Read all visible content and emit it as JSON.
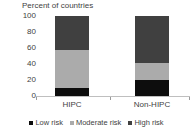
{
  "chart_data": {
    "type": "bar",
    "title": "Percent of countries",
    "subtitle": "",
    "xlabel": "",
    "ylabel": "Percent of countries",
    "stacked": true,
    "grid": false,
    "legend_position": "bottom",
    "ylim": [
      0,
      100
    ],
    "yticks": [
      0,
      20,
      40,
      60,
      80,
      100
    ],
    "ytick_labels": [
      "0",
      "20",
      "40",
      "60",
      "80",
      "100"
    ],
    "categories": [
      "HIPC",
      "Non-HIPC"
    ],
    "series": [
      {
        "name": "Low risk",
        "color": "#0d0d0d",
        "values": [
          10,
          20
        ]
      },
      {
        "name": "Moderate risk",
        "color": "#ababab",
        "values": [
          47,
          21
        ]
      },
      {
        "name": "High risk",
        "color": "#404040",
        "values": [
          43,
          59
        ]
      }
    ]
  },
  "axis": {
    "title": "Percent of countries",
    "ytick_labels": [
      "100",
      "80",
      "60",
      "40",
      "20",
      "0"
    ],
    "xtick_labels": [
      "HIPC",
      "Non-HIPC"
    ]
  },
  "legend": {
    "items": [
      {
        "label": "Low risk",
        "swatch": "legend-swatch-low-risk"
      },
      {
        "label": "Moderate risk",
        "swatch": "legend-swatch-moderate-risk"
      },
      {
        "label": "High risk",
        "swatch": "legend-swatch-high-risk"
      }
    ]
  },
  "colors": {
    "low_risk": "#0d0d0d",
    "moderate_risk": "#ababab",
    "high_risk": "#404040",
    "axis": "#bfbfbf",
    "text": "#3f3f3f",
    "background": "#ffffff"
  }
}
